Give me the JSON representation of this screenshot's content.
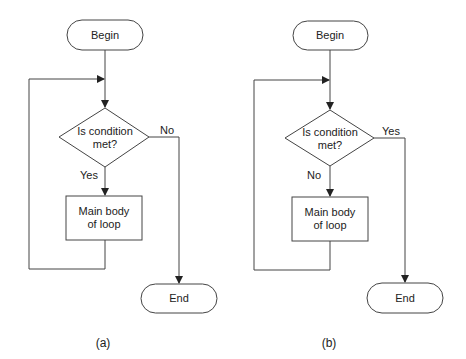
{
  "diagrams": [
    {
      "caption": "(a)",
      "begin": "Begin",
      "condition_line1": "Is condition",
      "condition_line2": "met?",
      "down_label": "Yes",
      "right_label": "No",
      "body_line1": "Main body",
      "body_line2": "of loop",
      "end": "End"
    },
    {
      "caption": "(b)",
      "begin": "Begin",
      "condition_line1": "Is condition",
      "condition_line2": "met?",
      "down_label": "No",
      "right_label": "Yes",
      "body_line1": "Main body",
      "body_line2": "of loop",
      "end": "End"
    }
  ]
}
